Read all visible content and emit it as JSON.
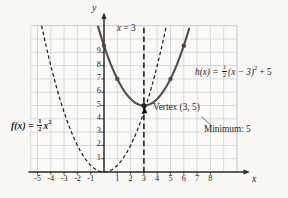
{
  "figure": {
    "background": "#f9f8f5",
    "grid_fill": "#fcfbf8",
    "grid_color": "#c3cdd3",
    "axis_color": "#2e2e2e",
    "curve_f_color": "#1a1a1a",
    "curve_h_color": "#4e4e4e",
    "point_color": "#5d4040",
    "vertex_color": "#262626"
  },
  "labels": {
    "axis_x": "x",
    "axis_y": "y",
    "x3": {
      "var": "x",
      "eq": "= 3"
    },
    "vertex": "Vertex (3, 5)",
    "minimum": "Minimum: 5",
    "f": {
      "lhs": "f(x) =",
      "num": "1",
      "den": "2",
      "body": "x",
      "sup": "2"
    },
    "h": {
      "lhs": "h(x) =",
      "num": "1",
      "den": "2",
      "body": "(x − 3)",
      "sup": "2",
      "tail": "+ 5"
    }
  },
  "axes": {
    "x_ticks": [
      "-5",
      "-4",
      "-3",
      "-2",
      "-1",
      "1",
      "2",
      "3",
      "4",
      "5",
      "6",
      "7",
      "8"
    ],
    "x_tick_values": [
      -5,
      -4,
      -3,
      -2,
      -1,
      1,
      2,
      3,
      4,
      5,
      6,
      7,
      8
    ],
    "y_ticks": [
      "1",
      "2",
      "3",
      "4",
      "5",
      "6",
      "7",
      "8",
      "9"
    ],
    "y_tick_values": [
      1,
      2,
      3,
      4,
      5,
      6,
      7,
      8,
      9
    ],
    "x_range_units": [
      -5.5,
      10
    ],
    "y_range_units": [
      0,
      11
    ],
    "grid": "on"
  },
  "chart_data": {
    "type": "line",
    "title": "",
    "xlabel": "x",
    "ylabel": "y",
    "xlim": [
      -5.5,
      10
    ],
    "ylim": [
      0,
      11
    ],
    "curves": [
      {
        "name": "f",
        "formula": "f(x) = (1/2)x^2",
        "a": 0.5,
        "h": 0,
        "k": 0,
        "style": "dashed",
        "vertex": [
          0,
          0
        ]
      },
      {
        "name": "h",
        "formula": "h(x) = (1/2)(x - 3)^2 + 5",
        "a": 0.5,
        "h": 3,
        "k": 5,
        "style": "solid",
        "vertex": [
          3,
          5
        ]
      }
    ],
    "marked_points_on_h": [
      {
        "x": 0,
        "y": 9.5
      },
      {
        "x": 1,
        "y": 7
      },
      {
        "x": 5,
        "y": 7
      },
      {
        "x": 6,
        "y": 9.5
      }
    ],
    "vertex_point": {
      "x": 3,
      "y": 5
    },
    "axis_of_symmetry_x": 3,
    "minimum_value": 5
  }
}
